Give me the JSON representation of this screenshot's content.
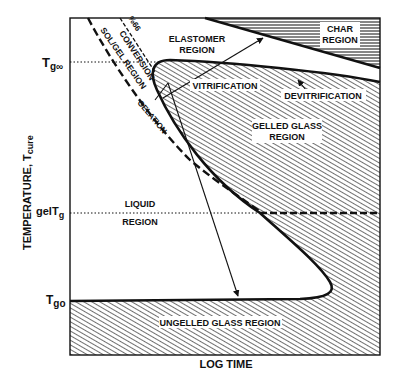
{
  "diagram": {
    "x_axis_label": "LOG TIME",
    "y_axis_label": "TEMPERATURE, T",
    "y_axis_label_sub": "cure",
    "y_ticks": [
      {
        "main": "T",
        "sub": "g∞",
        "key": "tg_inf"
      },
      {
        "main": "gelT",
        "sub": "g",
        "key": "gel_tg"
      },
      {
        "main": "T",
        "sub": "go",
        "key": "tg0"
      }
    ],
    "regions": {
      "char": [
        "CHAR",
        "REGION"
      ],
      "elastomer": [
        "ELASTOMER",
        "REGION"
      ],
      "gelled_glass": [
        "GELLED GLASS",
        "REGION"
      ],
      "liquid": [
        "LIQUID",
        "REGION"
      ],
      "ungelled_glass": "UNGELLED GLASS REGION",
      "sol_gel": "SOL/GEL REGION"
    },
    "curves": {
      "vitrification": "VITRIFICATION",
      "devitrification": "DEVITRIFICATION",
      "gelation": "GELATION",
      "full_conversion": [
        "99%",
        "CONVERSION"
      ]
    },
    "colors": {
      "ink": "#111111",
      "background": "#ffffff"
    }
  }
}
